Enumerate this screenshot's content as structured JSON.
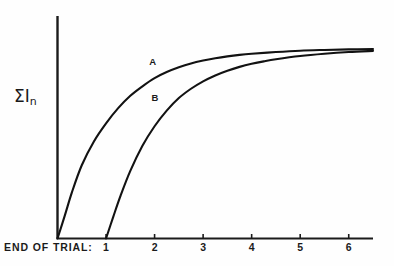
{
  "chart_data": {
    "type": "line",
    "title": "",
    "subtitle": "",
    "xlabel": "END OF TRIAL:",
    "ylabel": "ΣIₙ",
    "ylabel_base": "ΣI",
    "ylabel_subscript": "n",
    "grid": false,
    "legend_position": "inline-curve-labels",
    "x_ticks": [
      1,
      2,
      3,
      4,
      5,
      6
    ],
    "x_tick_labels": [
      "1",
      "2",
      "3",
      "4",
      "5",
      "6"
    ],
    "xlim": [
      0,
      6.5
    ],
    "ylim": [
      0,
      1.08
    ],
    "y_ticks": [],
    "y_tick_labels": [],
    "annotations": [
      {
        "text": "A",
        "x": 1.95,
        "y": 0.93
      },
      {
        "text": "B",
        "x": 2.0,
        "y": 0.74
      }
    ],
    "series": [
      {
        "name": "A",
        "label": "A",
        "color": "#121212",
        "x": [
          0,
          0.15,
          0.3,
          0.5,
          0.75,
          1.0,
          1.25,
          1.5,
          1.75,
          2.0,
          2.25,
          2.5,
          2.75,
          3.0,
          3.25,
          3.5,
          3.75,
          4.0,
          4.5,
          5.0,
          5.5,
          6.0,
          6.5
        ],
        "y": [
          0.0,
          0.12,
          0.245,
          0.385,
          0.51,
          0.605,
          0.685,
          0.75,
          0.8,
          0.843,
          0.875,
          0.9,
          0.92,
          0.935,
          0.947,
          0.957,
          0.965,
          0.971,
          0.98,
          0.987,
          0.991,
          0.994,
          0.996
        ]
      },
      {
        "name": "B",
        "label": "B",
        "color": "#121212",
        "x": [
          1.0,
          1.15,
          1.3,
          1.5,
          1.75,
          2.0,
          2.25,
          2.5,
          2.75,
          3.0,
          3.25,
          3.5,
          3.75,
          4.0,
          4.25,
          4.5,
          5.0,
          5.5,
          6.0,
          6.5
        ],
        "y": [
          0.0,
          0.115,
          0.225,
          0.355,
          0.487,
          0.59,
          0.672,
          0.738,
          0.787,
          0.826,
          0.857,
          0.882,
          0.902,
          0.918,
          0.931,
          0.942,
          0.959,
          0.971,
          0.98,
          0.986
        ]
      }
    ]
  },
  "axes": {
    "x_caption": "END OF TRIAL:",
    "tick_labels": [
      "1",
      "2",
      "3",
      "4",
      "5",
      "6"
    ],
    "y_label_base": "ΣI",
    "y_label_sub": "n"
  },
  "curve_labels": {
    "a": "A",
    "b": "B"
  },
  "colors": {
    "background": "#fefefe",
    "axis": "#1b1b1b",
    "curve": "#121212",
    "text": "#1b1b1b"
  }
}
